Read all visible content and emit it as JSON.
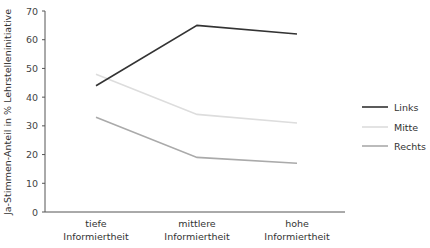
{
  "chart_data": {
    "type": "line",
    "title": "",
    "xlabel": "",
    "ylabel": "Ja-Stimmen-Anteil in % Lehrstelleninitiative",
    "categories": [
      [
        "tiefe",
        "Informiertheit"
      ],
      [
        "mittlere",
        "Informiertheit"
      ],
      [
        "hohe",
        "Informiertheit"
      ]
    ],
    "ylim": [
      0,
      70
    ],
    "yticks": [
      0,
      10,
      20,
      30,
      40,
      50,
      60,
      70
    ],
    "grid": false,
    "legend_position": "right",
    "series": [
      {
        "name": "Links",
        "color": "#333333",
        "values": [
          44,
          65,
          62
        ]
      },
      {
        "name": "Mitte",
        "color": "#dddddd",
        "values": [
          48,
          34,
          31
        ]
      },
      {
        "name": "Rechts",
        "color": "#aaaaaa",
        "values": [
          33,
          19,
          17
        ]
      }
    ]
  }
}
